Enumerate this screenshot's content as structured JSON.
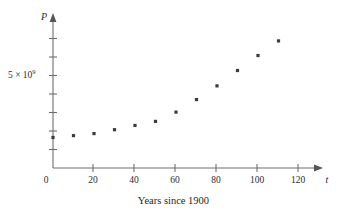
{
  "figure": {
    "caption": "Years since 1900",
    "background_color": "#ffffff",
    "point_color": "#3a3a40",
    "axis_color": "#6e6e72"
  },
  "axes": {
    "x_axis_name": "t",
    "y_axis_name": "P",
    "origin_label": "0",
    "y_tick_label_mantissa": "5 × 10",
    "y_tick_label_exponent": "9",
    "y_tick_label_full": "5 × 10^9",
    "x_tick_labels": [
      "20",
      "40",
      "60",
      "80",
      "100",
      "120"
    ]
  },
  "chart_data": {
    "type": "scatter",
    "title": "",
    "xlabel": "Years since 1900",
    "ylabel": "P",
    "x": [
      0,
      10,
      20,
      30,
      40,
      50,
      60,
      70,
      80,
      90,
      100,
      110
    ],
    "values": [
      1650000000,
      1750000000,
      1860000000,
      2070000000,
      2300000000,
      2520000000,
      3020000000,
      3700000000,
      4440000000,
      5270000000,
      6080000000,
      6870000000
    ],
    "xlim": [
      0,
      130
    ],
    "ylim": [
      0,
      8000000000
    ],
    "xticks": [
      0,
      20,
      40,
      60,
      80,
      100,
      120
    ],
    "yticks": [
      5000000000
    ],
    "y_minor_ticks": [
      1000000000,
      2000000000,
      3000000000,
      4000000000,
      5000000000,
      6000000000,
      7000000000
    ],
    "grid": false,
    "legend": false,
    "annotations": []
  }
}
